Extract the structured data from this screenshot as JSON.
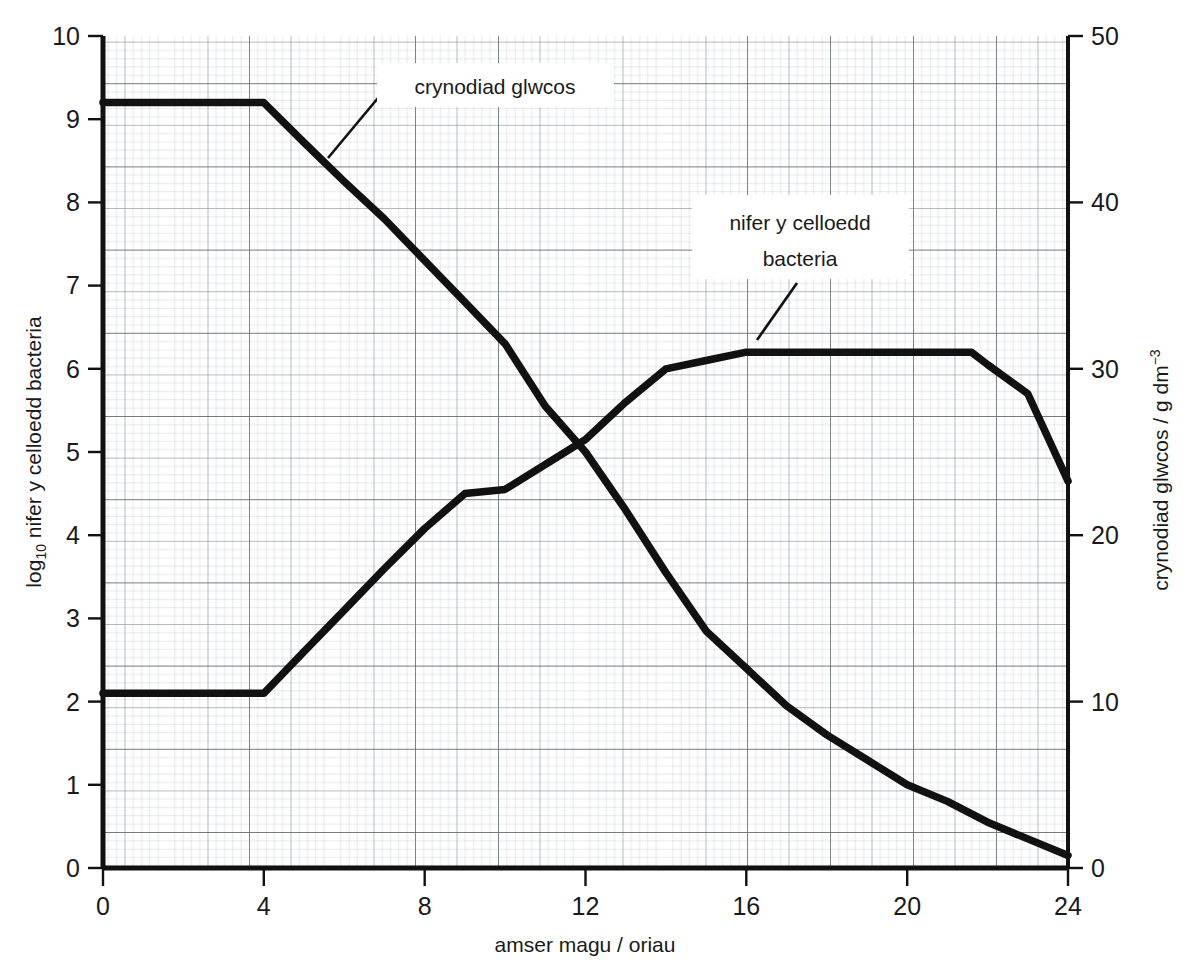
{
  "chart_data": {
    "type": "line",
    "title": "",
    "xlabel": "amser magu / oriau",
    "ylabel": "log10 nifer y celloedd bacteria",
    "ylabel_right": "crynodiad glwcos / g dm-3",
    "xlim": [
      0,
      24
    ],
    "ylim": [
      0,
      10
    ],
    "ylim_right": [
      0,
      50
    ],
    "xticks": [
      "0",
      "4",
      "8",
      "12",
      "16",
      "20",
      "24"
    ],
    "xtick_values": [
      0,
      4,
      8,
      12,
      16,
      20,
      24
    ],
    "yticks": [
      "0",
      "1",
      "2",
      "3",
      "4",
      "5",
      "6",
      "7",
      "8",
      "9",
      "10"
    ],
    "ytick_values": [
      0,
      1,
      2,
      3,
      4,
      5,
      6,
      7,
      8,
      9,
      10
    ],
    "yticks_right": [
      "0",
      "10",
      "20",
      "30",
      "40",
      "50"
    ],
    "ytick_right_values": [
      0,
      10,
      20,
      30,
      40,
      50
    ],
    "grid": true,
    "grid_style": "graph-paper",
    "line_color": "#111111",
    "grid_color": "#9aa0a6",
    "axis_color": "#111111",
    "series": [
      {
        "name": "nifer y celloedd bacteria",
        "axis": "left",
        "units": "log10 cells",
        "points": [
          [
            0,
            2.1
          ],
          [
            1,
            2.1
          ],
          [
            2,
            2.1
          ],
          [
            3,
            2.1
          ],
          [
            4,
            2.1
          ],
          [
            5,
            2.6
          ],
          [
            6,
            3.1
          ],
          [
            7,
            3.6
          ],
          [
            8,
            4.08
          ],
          [
            9,
            4.5
          ],
          [
            10,
            4.55
          ],
          [
            11,
            4.85
          ],
          [
            12,
            5.15
          ],
          [
            13,
            5.6
          ],
          [
            14,
            6.0
          ],
          [
            15,
            6.1
          ],
          [
            16,
            6.2
          ],
          [
            17,
            6.2
          ],
          [
            18,
            6.2
          ],
          [
            19,
            6.2
          ],
          [
            20,
            6.2
          ],
          [
            21,
            6.2
          ],
          [
            21.6,
            6.2
          ],
          [
            22,
            6.05
          ],
          [
            23,
            5.7
          ],
          [
            24,
            4.65
          ]
        ]
      },
      {
        "name": "crynodiad glwcos",
        "axis": "right",
        "units": "g dm-3",
        "points_left_scale": [
          [
            0,
            9.2
          ],
          [
            1,
            9.2
          ],
          [
            2,
            9.2
          ],
          [
            3,
            9.2
          ],
          [
            4,
            9.2
          ],
          [
            5,
            8.72
          ],
          [
            6,
            8.25
          ],
          [
            7,
            7.8
          ],
          [
            8,
            7.3
          ],
          [
            9,
            6.8
          ],
          [
            10,
            6.3
          ],
          [
            11,
            5.55
          ],
          [
            12,
            5.0
          ],
          [
            13,
            4.3
          ],
          [
            14,
            3.55
          ],
          [
            15,
            2.85
          ],
          [
            16,
            2.4
          ],
          [
            17,
            1.95
          ],
          [
            18,
            1.6
          ],
          [
            19,
            1.3
          ],
          [
            20,
            1.0
          ],
          [
            21,
            0.8
          ],
          [
            22,
            0.55
          ],
          [
            23,
            0.35
          ],
          [
            24,
            0.15
          ]
        ],
        "values_right_scale": [
          46.0,
          46.0,
          46.0,
          46.0,
          46.0,
          43.6,
          41.25,
          39.0,
          36.5,
          34.0,
          31.5,
          27.75,
          25.0,
          21.5,
          17.75,
          14.25,
          12.0,
          9.75,
          8.0,
          6.5,
          5.0,
          4.0,
          2.75,
          1.75,
          0.75
        ]
      }
    ],
    "annotations": [
      {
        "id": "glucose-label",
        "text": "crynodiad glwcos",
        "lines": [
          "crynodiad glwcos"
        ],
        "x": 7.0,
        "y": 9.1,
        "pointer_to_x": 5.6,
        "pointer_to_y": 8.4
      },
      {
        "id": "bacteria-label",
        "text": "nifer y celloedd bacteria",
        "lines": [
          "nifer y celloedd",
          "bacteria"
        ],
        "x": 16.6,
        "y": 7.7,
        "pointer_to_x": 15.0,
        "pointer_to_y": 6.15
      }
    ]
  }
}
